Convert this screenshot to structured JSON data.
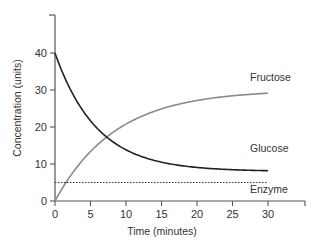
{
  "chart_data": {
    "type": "line",
    "title": "",
    "xlabel": "Time (minutes)",
    "ylabel": "Concentration (units)",
    "xlim": [
      0,
      35
    ],
    "ylim": [
      0,
      50
    ],
    "x_ticks": [
      0,
      5,
      10,
      15,
      20,
      25,
      30
    ],
    "y_ticks": [
      0,
      10,
      20,
      30,
      40
    ],
    "grid": false,
    "legend": "inline labels at right end of each line",
    "x": [
      0,
      2.5,
      5,
      7.5,
      10,
      12.5,
      15,
      17.5,
      20,
      22.5,
      25,
      27.5,
      30
    ],
    "series": [
      {
        "name": "Fructose",
        "color": "#8a8a8a",
        "style": "solid",
        "values": [
          0,
          7.7,
          13.4,
          17.7,
          20.9,
          23.3,
          25.1,
          26.4,
          27.4,
          28.1,
          28.6,
          29.0,
          29.3
        ]
      },
      {
        "name": "Glucose",
        "color": "#222222",
        "style": "solid",
        "values": [
          40,
          28.9,
          21.7,
          17.0,
          13.8,
          11.8,
          10.5,
          9.6,
          9.1,
          8.7,
          8.5,
          8.3,
          8.2
        ]
      },
      {
        "name": "Enzyme",
        "color": "#333333",
        "style": "dotted",
        "values": [
          5,
          5,
          5,
          5,
          5,
          5,
          5,
          5,
          5,
          5,
          5,
          5,
          5
        ]
      }
    ]
  }
}
